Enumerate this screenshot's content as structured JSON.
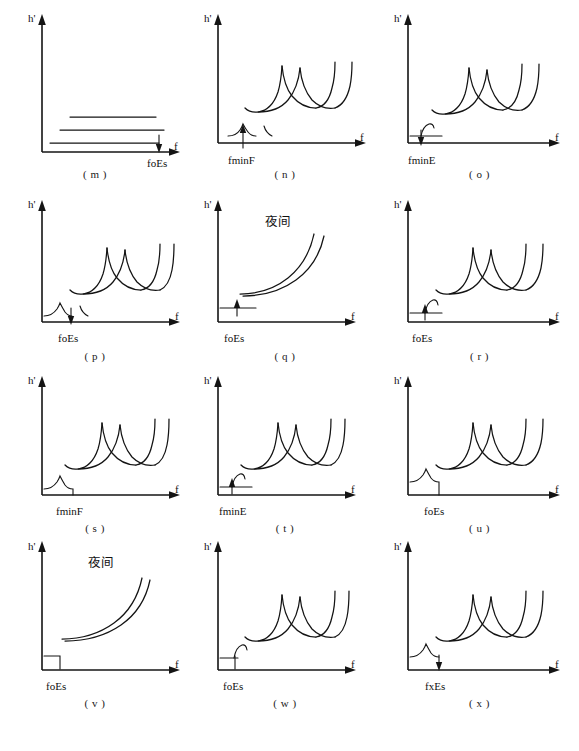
{
  "figure": {
    "kind": "ionogram-schematic-panel-set",
    "panel_count": 12,
    "rows": 4,
    "cols": 3,
    "axis": {
      "y_label": "h'",
      "x_label": "f"
    },
    "stroke_color": "#141414",
    "background_color": "#ffffff"
  },
  "panels": [
    {
      "id": "m",
      "caption": "( m )",
      "tick_label": "foEs",
      "annotation": "",
      "trace_type": "flat-blanketing-es-multi-hop",
      "arrow": "down",
      "arrow_at": "foEs",
      "f_traces": 0,
      "es_traces": 3
    },
    {
      "id": "n",
      "caption": "( n )",
      "tick_label": "fminF",
      "annotation": "",
      "trace_type": "f-region-multi-hop-with-low-es",
      "arrow": "up",
      "arrow_at": "fminF",
      "f_traces": 3,
      "es_traces": 2
    },
    {
      "id": "o",
      "caption": "( o )",
      "tick_label": "fminE",
      "annotation": "",
      "trace_type": "f-region-multi-hop-with-flat-e",
      "arrow": "down",
      "arrow_at": "fminE",
      "f_traces": 3,
      "es_traces": 1
    },
    {
      "id": "p",
      "caption": "( p )",
      "tick_label": "foEs",
      "annotation": "",
      "trace_type": "f-region-multi-hop-with-es-cusp",
      "arrow": "down",
      "arrow_at": "foEs",
      "f_traces": 3,
      "es_traces": 2
    },
    {
      "id": "q",
      "caption": "( q )",
      "tick_label": "foEs",
      "annotation": "夜间",
      "trace_type": "night-f-region-two-hop",
      "arrow": "up",
      "arrow_at": "foEs",
      "f_traces": 2,
      "es_traces": 1
    },
    {
      "id": "r",
      "caption": "( r )",
      "tick_label": "foEs",
      "annotation": "",
      "trace_type": "f-region-multi-hop-with-flat-es-hook",
      "arrow": "up",
      "arrow_at": "foEs",
      "f_traces": 3,
      "es_traces": 1
    },
    {
      "id": "s",
      "caption": "( s )",
      "tick_label": "fminF",
      "annotation": "",
      "trace_type": "f-region-multi-hop-with-es-step",
      "arrow": "none",
      "arrow_at": "fminF",
      "f_traces": 3,
      "es_traces": 1
    },
    {
      "id": "t",
      "caption": "( t )",
      "tick_label": "fminE",
      "annotation": "",
      "trace_type": "f-region-multi-hop-with-flat-e",
      "arrow": "up",
      "arrow_at": "fminE",
      "f_traces": 3,
      "es_traces": 1
    },
    {
      "id": "u",
      "caption": "( u )",
      "tick_label": "foEs",
      "annotation": "",
      "trace_type": "f-region-multi-hop-with-es-step",
      "arrow": "none",
      "arrow_at": "foEs",
      "f_traces": 3,
      "es_traces": 1
    },
    {
      "id": "v",
      "caption": "( v )",
      "tick_label": "foEs",
      "annotation": "夜间",
      "trace_type": "night-f-region-two-hop-with-es-step",
      "arrow": "none",
      "arrow_at": "foEs",
      "f_traces": 2,
      "es_traces": 1
    },
    {
      "id": "w",
      "caption": "( w )",
      "tick_label": "foEs",
      "annotation": "",
      "trace_type": "f-region-multi-hop-with-flat-es-hook",
      "arrow": "none",
      "arrow_at": "foEs",
      "f_traces": 3,
      "es_traces": 1
    },
    {
      "id": "x",
      "caption": "( x )",
      "tick_label": "fxEs",
      "annotation": "",
      "trace_type": "f-region-multi-hop-with-es-step",
      "arrow": "down",
      "arrow_at": "fxEs",
      "f_traces": 3,
      "es_traces": 1
    }
  ]
}
